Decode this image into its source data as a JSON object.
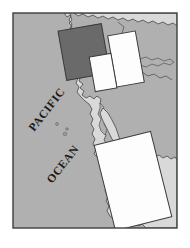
{
  "figure": {
    "name": "pacific-coast-study-area-map",
    "kind": "reference-location-map",
    "background_color": "#ffffff"
  },
  "frame": {
    "name": "map-frame",
    "x": 13,
    "y": 13,
    "width": 164,
    "height": 215,
    "border_color": "#3f3f3f",
    "border_width": 1.4
  },
  "palette": {
    "ocean": "#b0b0b0",
    "land": "#d9d9d9",
    "land_outline": "#555555",
    "box_dark_fill": "#6a6a6a",
    "box_light_fill": "#fdfdfd",
    "box_outline": "#3a3a3a",
    "label_color": "#1a1a1a",
    "page_background": "#ffffff"
  },
  "labels": [
    {
      "name": "pacific-label",
      "text": "PACIFIC",
      "x": 34,
      "y": 132,
      "rotation": -52,
      "font_size": 11.5,
      "letter_spacing": 0.6
    },
    {
      "name": "ocean-label",
      "text": "OCEAN",
      "x": 52,
      "y": 184,
      "rotation": -52,
      "font_size": 11.5,
      "letter_spacing": 0.6
    }
  ],
  "water_bodies": [
    {
      "name": "pacific-ocean-body",
      "label": "Pacific Ocean",
      "fill": "#b0b0b0"
    }
  ],
  "landmass": {
    "name": "north-america-landmass",
    "label": "North America",
    "fill": "#d9d9d9",
    "outline": "#555555",
    "outline_width": 0.9
  },
  "islands": [
    {
      "name": "island-marker-1",
      "cx": 57,
      "cy": 124,
      "r": 1.5
    },
    {
      "name": "island-marker-2",
      "cx": 67,
      "cy": 129,
      "r": 1.3
    },
    {
      "name": "island-marker-3",
      "cx": 65,
      "cy": 134,
      "r": 1.8
    }
  ],
  "study_boxes": [
    {
      "name": "study-box-dark",
      "label": "Study box 1",
      "fill": "#6a6a6a",
      "stroke": "#3a3a3a",
      "stroke_width": 1.0,
      "x": 62,
      "y": 27,
      "width": 44,
      "height": 50,
      "rotation": -10
    },
    {
      "name": "study-box-light-upper-right",
      "label": "Study box 2",
      "fill": "#fdfdfd",
      "stroke": "#3a3a3a",
      "stroke_width": 1.0,
      "x": 112,
      "y": 33,
      "width": 28,
      "height": 52,
      "rotation": -10
    },
    {
      "name": "study-box-light-middle",
      "label": "Study box 3",
      "fill": "#fdfdfd",
      "stroke": "#3a3a3a",
      "stroke_width": 1.0,
      "x": 92,
      "y": 55,
      "width": 22,
      "height": 35,
      "rotation": -10
    },
    {
      "name": "study-box-light-lower",
      "label": "Study box 4",
      "fill": "#fdfdfd",
      "stroke": "#3a3a3a",
      "stroke_width": 1.0,
      "x": 104,
      "y": 137,
      "width": 58,
      "height": 88,
      "rotation": -14
    }
  ]
}
